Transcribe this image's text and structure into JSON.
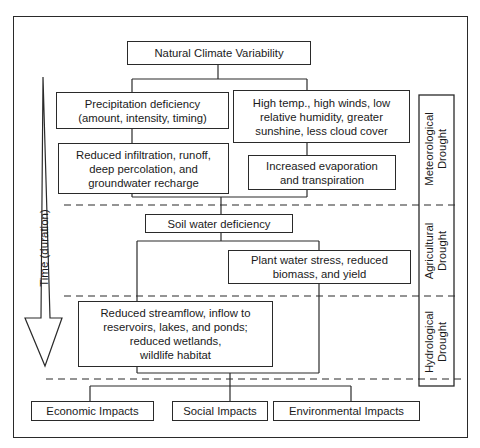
{
  "diagram": {
    "title_node": "Natural Climate Variability",
    "meteorological": {
      "left_branch": [
        "Precipitation deficiency\n(amount, intensity, timing)",
        "Reduced infiltration, runoff,\ndeep percolation, and\ngroundwater recharge"
      ],
      "right_branch": [
        "High temp., high winds, low\nrelative humidity, greater\nsunshine, less cloud cover",
        "Increased evaporation\nand transpiration"
      ]
    },
    "agricultural": {
      "soil": "Soil water deficiency",
      "plant": "Plant water stress, reduced\nbiomass, and yield"
    },
    "hydrological": {
      "streamflow": "Reduced streamflow, inflow to\nreservoirs, lakes, and ponds;\nreduced wetlands,\nwildlife habitat"
    },
    "impacts": [
      "Economic Impacts",
      "Social Impacts",
      "Environmental Impacts"
    ],
    "drought_labels": [
      "Meteorological\nDrought",
      "Agricultural\nDrought",
      "Hydrological\nDrought"
    ],
    "time_arrow_label": "Time (duration)",
    "colors": {
      "line": "#2a2a2a",
      "background": "#ffffff"
    }
  }
}
